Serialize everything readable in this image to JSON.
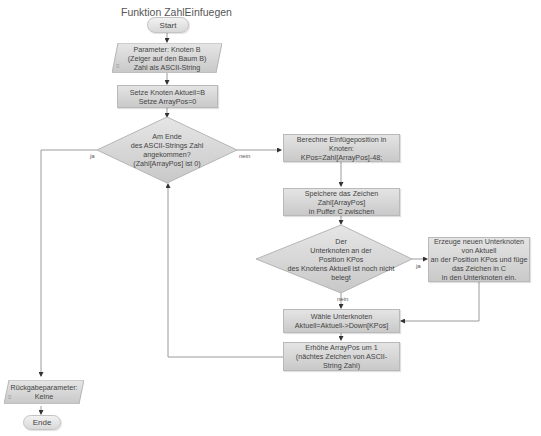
{
  "title": "Funktion ZahlEinfuegen",
  "nodes": {
    "start": "Start",
    "params": "Parameter: Knoten B\n(Zeiger auf den Baum B)\nZahl als ASCII-String",
    "init": "Setze Knoten Aktuell=B\nSetze ArrayPos=0",
    "cond_end": "Am Ende\ndes ASCII-Strings Zahl\nangekommen?\n(Zahl[ArrayPos] ist 0)",
    "calc_pos": "Berechne Einfügeposition in\nKnoten:\nKPos=Zahl[ArrayPos]-48;",
    "store_char": "Speichere das Zeichen\nZahl[ArrayPos]\nin Puffer C zwischen",
    "cond_free": "Der\nUnterknoten an der\nPosition KPos\ndes Knotens Aktuell ist noch nicht\nbelegt",
    "create_node": "Erzeuge neuen Unterknoten\nvon Aktuell\nan der Position KPos und füge\ndas Zeichen in C\nin den Unterknoten ein.",
    "select_child": "Wähle Unterknoten\nAktuell=Aktuell->Down[KPos]",
    "increment": "Erhöhe ArrayPos um 1\n(nächtes Zeichen von ASCII-\nString Zahl)",
    "return_params": "Rückgabeparameter:\nKeine",
    "end": "Ende"
  },
  "edge_labels": {
    "cond_end_yes": "ja",
    "cond_end_no": "nein",
    "cond_free_yes": "ja",
    "cond_free_no": "nein"
  },
  "colors": {
    "box_top": "#e4e4e4",
    "box_bottom": "#c9c9c9",
    "line": "#9a9a9a",
    "text": "#444444"
  }
}
